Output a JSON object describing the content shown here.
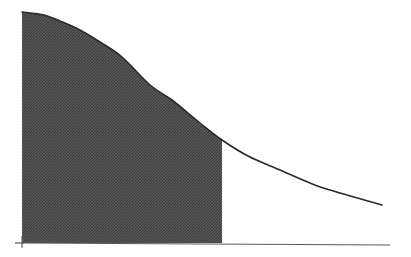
{
  "figure": {
    "name": "shaded-area-under-decreasing-curve",
    "width": 411,
    "height": 257,
    "background_color": "#ffffff",
    "has_visible_text": false,
    "title": "",
    "subtitle": "",
    "caption": ""
  },
  "style": {
    "curve_color": "#2b2b2b",
    "curve_width": 1.6,
    "axis_color": "#5a5a5a",
    "axis_width": 1.2,
    "fill_color": "#4d4d4d",
    "fill_pattern": "halftone-dither",
    "fill_dot_color": "#3a3a3a",
    "fill_base_color": "#565656",
    "tick_color": "#5a5a5a"
  },
  "geometry": {
    "x_axis": {
      "x1": 22,
      "y1": 243,
      "x2": 390,
      "y2": 245
    },
    "y_axis_tick": {
      "x1": 15,
      "y1": 243,
      "x2": 24,
      "y2": 243
    },
    "y_axis_stub": {
      "x1": 22,
      "y1": 236,
      "x2": 22,
      "y2": 248
    },
    "shade_left_x": 22,
    "shade_right_x": 222,
    "baseline_y": 243,
    "curve_start": {
      "x": 22,
      "y": 12
    },
    "curve_end": {
      "x": 382,
      "y": 205
    }
  },
  "chart_data": {
    "type": "area",
    "title": "",
    "subtitle": "",
    "xlabel": "",
    "ylabel": "",
    "grid": false,
    "legend": null,
    "legend_position": "none",
    "xlim": [
      0,
      1
    ],
    "ylim": [
      0,
      1
    ],
    "xticks": [],
    "xticklabels": [],
    "yticks": [],
    "yticklabels": [],
    "annotations": [],
    "series": [
      {
        "name": "curve",
        "kind": "line",
        "x": [
          0.0,
          0.06,
          0.11,
          0.16,
          0.22,
          0.28,
          0.36,
          0.42,
          0.49,
          0.56,
          0.62,
          0.72,
          0.81,
          0.89,
          1.0
        ],
        "y": [
          1.0,
          0.96,
          0.92,
          0.87,
          0.78,
          0.68,
          0.58,
          0.5,
          0.44,
          0.38,
          0.34,
          0.29,
          0.25,
          0.22,
          0.18
        ],
        "pixel_points": [
          {
            "x": 22,
            "y": 12
          },
          {
            "x": 44,
            "y": 15
          },
          {
            "x": 60,
            "y": 21
          },
          {
            "x": 78,
            "y": 29
          },
          {
            "x": 100,
            "y": 42
          },
          {
            "x": 122,
            "y": 57
          },
          {
            "x": 150,
            "y": 85
          },
          {
            "x": 172,
            "y": 100
          },
          {
            "x": 200,
            "y": 123
          },
          {
            "x": 222,
            "y": 140
          },
          {
            "x": 248,
            "y": 156
          },
          {
            "x": 280,
            "y": 170
          },
          {
            "x": 310,
            "y": 183
          },
          {
            "x": 330,
            "y": 190
          },
          {
            "x": 382,
            "y": 205
          }
        ]
      },
      {
        "name": "shaded-region",
        "kind": "area-fill",
        "x_from": 0.0,
        "x_to": 0.54,
        "fill": "#4d4d4d"
      }
    ]
  }
}
